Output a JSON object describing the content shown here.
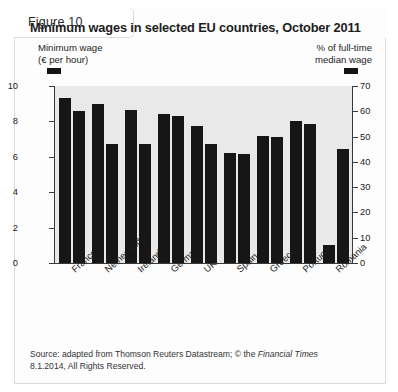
{
  "figure": {
    "label": "Figure 10",
    "title": "Minimum wages in selected EU countries, October 2011"
  },
  "legend": {
    "left": {
      "line1": "Minimum wage",
      "line2": "(€ per hour)",
      "swatch_color": "#141414",
      "swatch_name": "minimum-wage-swatch"
    },
    "right": {
      "line1": "% of full-time",
      "line2": "median wage",
      "swatch_color": "#141414",
      "swatch_name": "median-wage-swatch"
    }
  },
  "source": {
    "line1_a": "Source: adapted from Thomson Reuters Datastream; © the ",
    "line1_it": "Financial Times",
    "line2": "8.1.2014, All Rights Reserved."
  },
  "chart_data": {
    "type": "bar",
    "title": "Minimum wages in selected EU countries, October 2011",
    "xlabel": "",
    "categories": [
      "France",
      "Netherlands",
      "Ireland",
      "Germany",
      "UK",
      "Spain",
      "Greece",
      "Portugal",
      "Romania"
    ],
    "series": [
      {
        "name": "Minimum wage (€ per hour)",
        "axis": "left",
        "color": "#161616",
        "values": [
          9.3,
          9.0,
          8.65,
          8.4,
          7.75,
          6.2,
          7.2,
          8.0,
          1.0
        ]
      },
      {
        "name": "% of full-time median wage",
        "axis": "right",
        "color": "#161616",
        "values": [
          60,
          47,
          47,
          58,
          47,
          43,
          50,
          55,
          45
        ]
      }
    ],
    "left_axis": {
      "ylabel": "Minimum wage (€ per hour)",
      "ylim": [
        0,
        10
      ],
      "ticks": [
        0,
        2,
        4,
        6,
        8,
        10
      ]
    },
    "right_axis": {
      "ylabel": "% of full-time median wage",
      "ylim": [
        0,
        70
      ],
      "ticks": [
        0,
        10,
        20,
        30,
        40,
        50,
        60,
        70
      ]
    },
    "grid": false,
    "legend_position": "top"
  }
}
